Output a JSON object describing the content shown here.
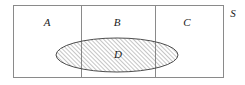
{
  "figure": {
    "type": "venn-partition-diagram",
    "title": "",
    "universe": {
      "label": "S",
      "label_position": "outside-top-right",
      "rect": {
        "x": 13,
        "y": 5,
        "width": 211,
        "height": 73
      },
      "stroke_color": "#8a8a8a",
      "fill_color": "#ffffff",
      "stroke_width": 1
    },
    "dividers": [
      {
        "name": "divider-a-b",
        "x": 81,
        "y1": 5,
        "y2": 78
      },
      {
        "name": "divider-b-c",
        "x": 155,
        "y1": 5,
        "y2": 78
      }
    ],
    "regions": [
      {
        "id": "A",
        "label": "A",
        "cx": 47,
        "cy": 22
      },
      {
        "id": "B",
        "label": "B",
        "cx": 117,
        "cy": 22
      },
      {
        "id": "C",
        "label": "C",
        "cx": 187,
        "cy": 22
      }
    ],
    "ellipse": {
      "id": "D",
      "label": "D",
      "label_cx": 118,
      "label_cy": 54,
      "cx": 117,
      "cy": 55,
      "rx": 61,
      "ry": 17,
      "fill_pattern": "diagonal-hatch",
      "hatch_color": "#6e6e6e",
      "hatch_spacing": 3,
      "hatch_angle_deg": 45,
      "stroke_color": "#4d4d4d",
      "stroke_width": 1
    },
    "colors": {
      "ink": "#1a1a1a",
      "frame": "#8a8a8a",
      "hatch": "#6e6e6e",
      "background": "#ffffff"
    }
  }
}
